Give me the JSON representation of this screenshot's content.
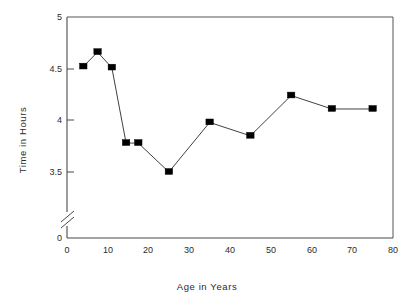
{
  "chart_data": {
    "type": "line",
    "title": "",
    "xlabel": "Age in Years",
    "ylabel": "Time in Hours",
    "x": [
      4,
      7.5,
      11,
      14.5,
      17.5,
      25,
      35,
      45,
      55,
      65,
      75
    ],
    "values": [
      4.52,
      4.66,
      4.51,
      3.78,
      3.78,
      3.5,
      3.98,
      3.85,
      4.24,
      4.11,
      4.11
    ],
    "series": [
      {
        "name": "Time in Hours",
        "values": [
          4.52,
          4.66,
          4.51,
          3.78,
          3.78,
          3.5,
          3.98,
          3.85,
          4.24,
          4.11,
          4.11
        ]
      }
    ],
    "xlim": [
      0,
      80
    ],
    "ylim": [
      3.5,
      5
    ],
    "y_axis_break": true,
    "y_axis_break_note": "axis broken between 0 and 3.5",
    "xticks": [
      0,
      10,
      20,
      30,
      40,
      50,
      60,
      70,
      80
    ],
    "yticks": [
      0,
      3.5,
      4,
      4.5,
      5
    ],
    "xtick_labels": [
      "0",
      "10",
      "20",
      "30",
      "40",
      "50",
      "60",
      "70",
      "80"
    ],
    "ytick_labels": [
      "0",
      "3.5",
      "4",
      "4.5",
      "5"
    ],
    "grid": false,
    "legend": false,
    "legend_position": "none",
    "marker": "filled-square",
    "marker_color": "#000000",
    "line_color": "#2a2a2a"
  },
  "axes": {
    "y_title": "Time in Hours",
    "x_title": "Age in Years",
    "y_ticks": [
      {
        "label": "5",
        "value": 5
      },
      {
        "label": "4.5",
        "value": 4.5
      },
      {
        "label": "4",
        "value": 4
      },
      {
        "label": "3.5",
        "value": 3.5
      },
      {
        "label": "0",
        "value": 0
      }
    ],
    "x_ticks": [
      {
        "label": "0",
        "value": 0
      },
      {
        "label": "10",
        "value": 10
      },
      {
        "label": "20",
        "value": 20
      },
      {
        "label": "30",
        "value": 30
      },
      {
        "label": "40",
        "value": 40
      },
      {
        "label": "50",
        "value": 50
      },
      {
        "label": "60",
        "value": 60
      },
      {
        "label": "70",
        "value": 70
      },
      {
        "label": "80",
        "value": 80
      }
    ]
  }
}
